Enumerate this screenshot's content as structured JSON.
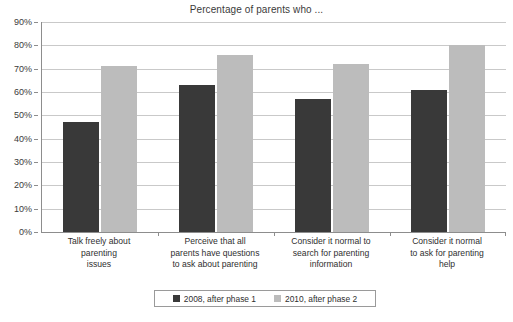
{
  "chart_data": {
    "type": "bar",
    "title": "Percentage of parents who ...",
    "xlabel": "",
    "ylabel": "",
    "ylim": [
      0,
      90
    ],
    "ytick_labels": [
      "0%",
      "10%",
      "20%",
      "30%",
      "40%",
      "50%",
      "60%",
      "70%",
      "80%",
      "90%"
    ],
    "ytick_values": [
      0,
      10,
      20,
      30,
      40,
      50,
      60,
      70,
      80,
      90
    ],
    "grid": true,
    "legend_position": "bottom",
    "categories": [
      "Talk freely about parenting issues",
      "Perceive that all parents have questions to ask about parenting",
      "Consider it normal to search for parenting information",
      "Consider it normal to ask for parenting help"
    ],
    "category_lines": [
      [
        "Talk freely about",
        "parenting",
        "issues"
      ],
      [
        "Perceive that all",
        "parents have questions",
        "to ask about parenting"
      ],
      [
        "Consider it normal to",
        "search for parenting",
        "information"
      ],
      [
        "Consider it normal",
        "to ask for parenting",
        "help"
      ]
    ],
    "series": [
      {
        "name": "2008, after phase 1",
        "color": "#393939",
        "values": [
          47,
          63,
          57,
          61
        ]
      },
      {
        "name": "2010, after phase 2",
        "color": "#bcbcbc",
        "values": [
          71,
          76,
          72,
          80
        ]
      }
    ]
  },
  "legend": {
    "entries": [
      {
        "label": "2008, after phase 1"
      },
      {
        "label": "2010, after phase 2"
      }
    ]
  }
}
